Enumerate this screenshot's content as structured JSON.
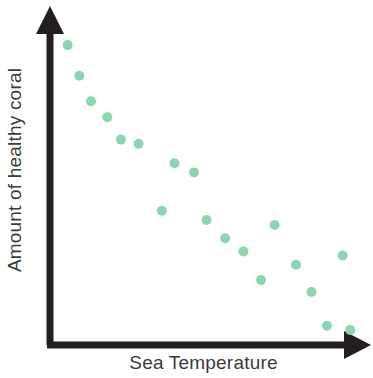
{
  "chart_data": {
    "type": "scatter",
    "title": "",
    "subtitle": "",
    "xlabel": "Sea Temperature",
    "ylabel": "Amount of healthy coral",
    "grid": false,
    "legend": null,
    "axis_style": "arrow-headed two-axis (L-shaped), no tick marks, no tick labels",
    "axis_color": "#231f20",
    "point_color": "#8bd6b0",
    "point_radius": 5,
    "xlim": [
      0,
      100
    ],
    "ylim": [
      0,
      100
    ],
    "x_tick_labels": [],
    "y_tick_labels": [],
    "points": [
      {
        "x": 5.6,
        "y": 95.2
      },
      {
        "x": 9.3,
        "y": 85.5
      },
      {
        "x": 13.0,
        "y": 77.4
      },
      {
        "x": 18.2,
        "y": 72.3
      },
      {
        "x": 22.5,
        "y": 65.2
      },
      {
        "x": 28.1,
        "y": 63.9
      },
      {
        "x": 39.5,
        "y": 57.7
      },
      {
        "x": 45.7,
        "y": 54.8
      },
      {
        "x": 35.5,
        "y": 42.6
      },
      {
        "x": 49.7,
        "y": 39.7
      },
      {
        "x": 71.3,
        "y": 38.1
      },
      {
        "x": 55.6,
        "y": 33.9
      },
      {
        "x": 61.4,
        "y": 29.7
      },
      {
        "x": 92.9,
        "y": 28.4
      },
      {
        "x": 78.1,
        "y": 25.5
      },
      {
        "x": 67.0,
        "y": 20.6
      },
      {
        "x": 83.0,
        "y": 16.8
      },
      {
        "x": 87.9,
        "y": 6.1
      },
      {
        "x": 95.3,
        "y": 4.8
      }
    ]
  },
  "figure": {
    "background": "#ffffff",
    "xlabel": "Sea Temperature",
    "ylabel": "Amount of healthy coral"
  }
}
